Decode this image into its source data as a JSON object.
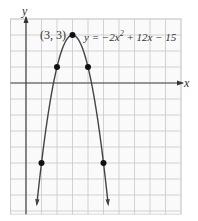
{
  "chart_data": {
    "type": "line",
    "title": "",
    "equation": "y = −2x² + 12x − 15",
    "equation_parts": {
      "pre": "y = −2x",
      "sup": "2",
      "post": " + 12x − 15"
    },
    "xlabel": "x",
    "ylabel": "y",
    "xlim": [
      -1,
      10
    ],
    "ylim": [
      -8.2,
      4
    ],
    "grid": true,
    "legend": null,
    "series": [
      {
        "name": "y = -2x^2 + 12x - 15",
        "function": "-2*x*x + 12*x - 15",
        "x_range": [
          0.7,
          5.3
        ],
        "color": "#444444"
      }
    ],
    "points": [
      {
        "x": 3,
        "y": 3,
        "label": "(3, 3)"
      },
      {
        "x": 2,
        "y": 1
      },
      {
        "x": 4,
        "y": 1
      },
      {
        "x": 1,
        "y": -5
      },
      {
        "x": 5,
        "y": -5
      }
    ],
    "annotations": [
      "(3, 3)",
      "y = −2x² + 12x − 15"
    ]
  },
  "labels": {
    "vertex": "(3, 3)",
    "x_axis": "x",
    "y_axis": "y"
  }
}
